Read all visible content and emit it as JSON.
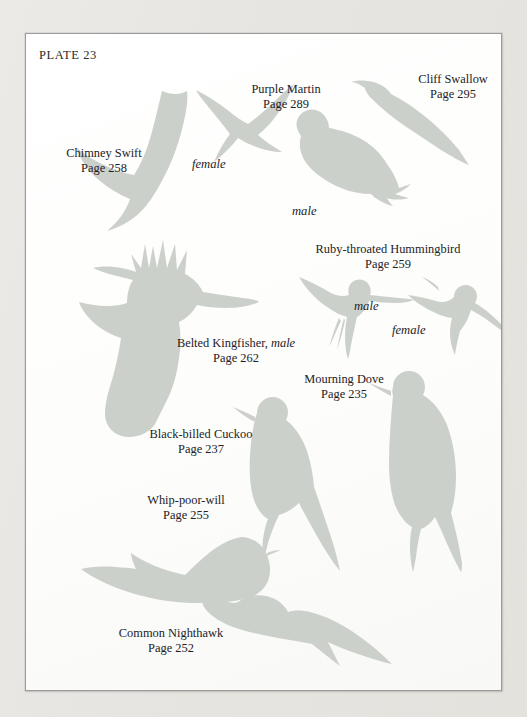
{
  "plate": {
    "title": "PLATE 23",
    "ink_color": "#23211f",
    "silhouette_color": "#ccd0cb",
    "paper_color": "#fdfdfc",
    "scan_background_color": "#e9e7e3"
  },
  "birds": [
    {
      "key": "chimney-swift",
      "name": "Chimney Swift",
      "page": "Page 258"
    },
    {
      "key": "purple-martin",
      "name": "Purple Martin",
      "page": "Page 289"
    },
    {
      "key": "cliff-swallow",
      "name": "Cliff Swallow",
      "page": "Page 295"
    },
    {
      "key": "ruby-throated-hummingbird",
      "name": "Ruby-throated Hummingbird",
      "page": "Page 259"
    },
    {
      "key": "belted-kingfisher",
      "name": "Belted Kingfisher,",
      "sex": "male",
      "page": "Page 262"
    },
    {
      "key": "mourning-dove",
      "name": "Mourning Dove",
      "page": "Page 235"
    },
    {
      "key": "black-billed-cuckoo",
      "name": "Black-billed Cuckoo",
      "page": "Page 237"
    },
    {
      "key": "whip-poor-will",
      "name": "Whip-poor-will",
      "page": "Page 255"
    },
    {
      "key": "common-nighthawk",
      "name": "Common Nighthawk",
      "page": "Page 252"
    }
  ],
  "sex_labels": {
    "martin_female": "female",
    "martin_male": "male",
    "hummingbird_male": "male",
    "hummingbird_female": "female"
  }
}
